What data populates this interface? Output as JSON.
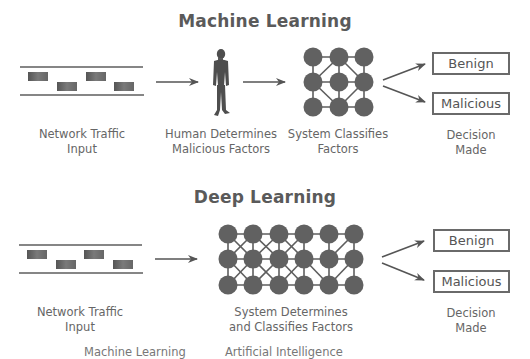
{
  "colors": {
    "node": "#616161",
    "line": "#5e5e5e",
    "packet": "#6f6f6f",
    "text": "#666666",
    "title": "#5a5a5a",
    "background": "#ffffff"
  },
  "sections": [
    {
      "title": "Machine Learning",
      "steps": [
        {
          "icon": "network-traffic-icon",
          "label_line1": "Network Traffic",
          "label_line2": "Input"
        },
        {
          "icon": "human-icon",
          "label_line1": "Human Determines",
          "label_line2": "Malicious Factors"
        },
        {
          "icon": "neural-network-3x3-icon",
          "label_line1": "System Classifies",
          "label_line2": "Factors"
        },
        {
          "icon": "decision-icon",
          "label_line1": "Decision",
          "label_line2": "Made"
        }
      ],
      "outcomes": [
        "Benign",
        "Malicious"
      ]
    },
    {
      "title": "Deep Learning",
      "steps": [
        {
          "icon": "network-traffic-icon",
          "label_line1": "Network Traffic",
          "label_line2": "Input"
        },
        {
          "icon": "neural-network-6x3-icon",
          "label_line1": "System Determines",
          "label_line2": "and Classifies Factors"
        },
        {
          "icon": "decision-icon",
          "label_line1": "Decision",
          "label_line2": "Made"
        }
      ],
      "outcomes": [
        "Benign",
        "Malicious"
      ]
    }
  ],
  "footer_cut_text": {
    "left": "Machine Learning",
    "right": "Artificial Intelligence"
  }
}
